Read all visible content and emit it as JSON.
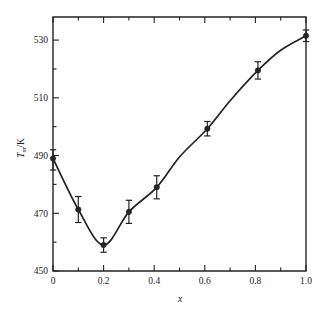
{
  "figure": {
    "background_color": "#ffffff",
    "ink_color": "#232323",
    "frame": {
      "left": 53,
      "right": 306,
      "top": 17,
      "bottom": 271
    }
  },
  "axes": {
    "x": {
      "label": "x",
      "label_italic": true,
      "min": 0,
      "max": 1.0,
      "major_ticks": [
        0,
        0.2,
        0.4,
        0.6,
        0.8,
        1.0
      ],
      "major_tick_labels": [
        "0",
        "0.2",
        "0.4",
        "0.6",
        "0.8",
        "1.0"
      ],
      "minor_ticks": [
        0.1,
        0.3,
        0.5,
        0.7,
        0.9
      ],
      "ticks_direction": "inward",
      "mirrored_top_axis": true
    },
    "y": {
      "label_parts": {
        "symbol": "T",
        "subscript": "m",
        "unit": "/K"
      },
      "label_plain": "Tm/K",
      "min": 450,
      "max": 538,
      "major_ticks": [
        450,
        470,
        490,
        510,
        530
      ],
      "major_tick_labels": [
        "450",
        "470",
        "490",
        "510",
        "530"
      ],
      "minor_ticks": [
        460,
        480,
        500,
        520
      ],
      "ticks_direction": "inward",
      "mirrored_right_axis": false
    }
  },
  "chart_data": {
    "type": "line",
    "title": "",
    "xlabel": "x",
    "ylabel": "Tm/K",
    "xlim": [
      0,
      1.0
    ],
    "ylim": [
      450,
      538
    ],
    "grid": false,
    "legend": null,
    "marker": "filled-circle",
    "error_bars": true,
    "x": [
      0.0,
      0.1,
      0.2,
      0.3,
      0.41,
      0.61,
      0.81,
      1.0
    ],
    "values": [
      489.0,
      471.3,
      459.0,
      470.5,
      479.0,
      499.3,
      519.5,
      531.5
    ],
    "y_err_lower": [
      4.0,
      4.5,
      2.5,
      4.0,
      4.0,
      2.5,
      3.0,
      2.0
    ],
    "y_err_upper": [
      3.0,
      4.5,
      2.5,
      4.0,
      4.0,
      2.5,
      3.0,
      2.0
    ],
    "series": [
      {
        "name": "Tm",
        "x": [
          0.0,
          0.1,
          0.2,
          0.3,
          0.41,
          0.61,
          0.81,
          1.0
        ],
        "values": [
          489.0,
          471.3,
          459.0,
          470.5,
          479.0,
          499.3,
          519.5,
          531.5
        ]
      }
    ],
    "curve_points": [
      [
        0.0,
        489.0
      ],
      [
        0.1,
        471.3
      ],
      [
        0.2,
        459.0
      ],
      [
        0.3,
        470.5
      ],
      [
        0.41,
        479.0
      ],
      [
        0.5,
        489.5
      ],
      [
        0.61,
        499.3
      ],
      [
        0.7,
        509.0
      ],
      [
        0.81,
        519.5
      ],
      [
        0.9,
        526.5
      ],
      [
        1.0,
        531.5
      ]
    ]
  }
}
